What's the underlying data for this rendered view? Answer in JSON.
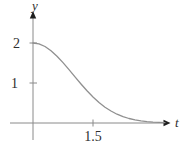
{
  "figure": {
    "background": "#ffffff",
    "axis_color": "#8a8a8a",
    "arrow_color": "#1f1f1f",
    "curve_color": "#909090",
    "text_color": "#2e2e2e"
  },
  "chart_data": {
    "type": "line",
    "title": "",
    "xlabel": "t",
    "ylabel": "y",
    "grid": false,
    "legend": "none",
    "xlim": [
      -0.55,
      3.45
    ],
    "ylim": [
      -0.45,
      2.75
    ],
    "x_ticks": [
      {
        "value": 1.5,
        "label": "1.5"
      }
    ],
    "y_ticks": [
      {
        "value": 2,
        "label": "2"
      },
      {
        "value": 1,
        "label": "1"
      }
    ],
    "series": [
      {
        "name": "y(t) = 2e^(-t^2/2)",
        "x": [
          0,
          0.15,
          0.3,
          0.45,
          0.6,
          0.75,
          0.9,
          1.05,
          1.2,
          1.35,
          1.5,
          1.65,
          1.8,
          1.95,
          2.1,
          2.25,
          2.4,
          2.55,
          2.7,
          2.85,
          3.0,
          3.15,
          3.3
        ],
        "y": [
          2.0,
          1.978,
          1.912,
          1.808,
          1.671,
          1.51,
          1.334,
          1.152,
          0.974,
          0.804,
          0.649,
          0.513,
          0.396,
          0.299,
          0.22,
          0.159,
          0.112,
          0.077,
          0.052,
          0.034,
          0.022,
          0.014,
          0.009
        ]
      }
    ]
  }
}
